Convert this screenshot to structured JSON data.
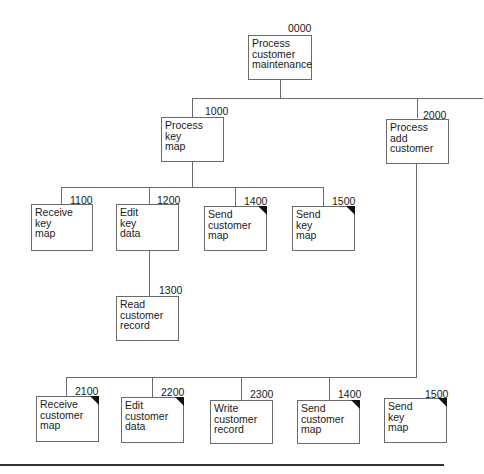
{
  "diagram": {
    "type": "structure-chart",
    "modules": [
      {
        "id": "0000",
        "label": "Process\ncustomer\nmaintenance",
        "common": false
      },
      {
        "id": "1000",
        "label": "Process\nkey\nmap",
        "common": false
      },
      {
        "id": "2000",
        "label": "Process\nadd\ncustomer",
        "common": false
      },
      {
        "id": "1100",
        "label": "Receive\nkey\nmap",
        "common": false
      },
      {
        "id": "1200",
        "label": "Edit\nkey\ndata",
        "common": false
      },
      {
        "id": "1400",
        "label": "Send\ncustomer\nmap",
        "common": true
      },
      {
        "id": "1500",
        "label": "Send\nkey\nmap",
        "common": true
      },
      {
        "id": "1300",
        "label": "Read\ncustomer\nrecord",
        "common": false
      },
      {
        "id": "2100",
        "label": "Receive\ncustomer\nmap",
        "common": true
      },
      {
        "id": "2200",
        "label": "Edit\ncustomer\ndata",
        "common": true
      },
      {
        "id": "2300",
        "label": "Write\ncustomer\nrecord",
        "common": false
      },
      {
        "id": "1400",
        "label": "Send\ncustomer\nmap",
        "common": true
      },
      {
        "id": "1500",
        "label": "Send\nkey\nmap",
        "common": true
      }
    ],
    "edges": [
      [
        "0000",
        "1000"
      ],
      [
        "0000",
        "2000"
      ],
      [
        "1000",
        "1100"
      ],
      [
        "1000",
        "1200"
      ],
      [
        "1000",
        "1400"
      ],
      [
        "1000",
        "1500"
      ],
      [
        "1200",
        "1300"
      ],
      [
        "2000",
        "2100"
      ],
      [
        "2000",
        "2200"
      ],
      [
        "2000",
        "2300"
      ],
      [
        "2000",
        "1400"
      ],
      [
        "2000",
        "1500"
      ]
    ]
  }
}
